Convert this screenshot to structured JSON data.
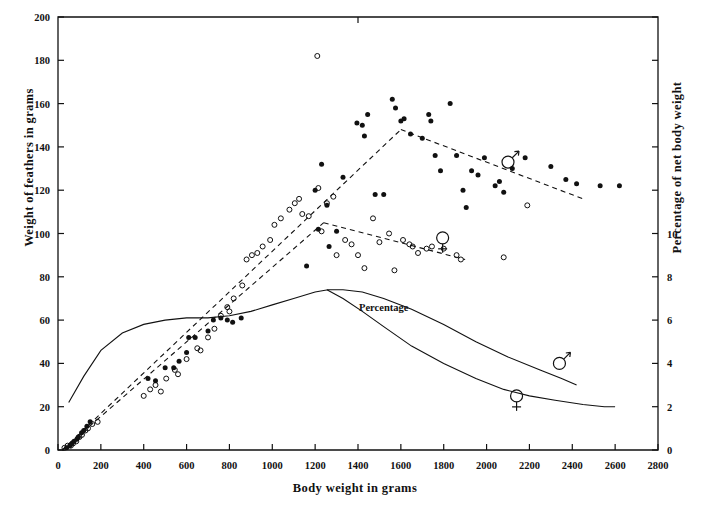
{
  "chart_data": {
    "type": "scatter",
    "title": "",
    "xlabel": "Body weight in grams",
    "ylabel": "Weight of feathers in grams",
    "ylabel_right": "Percentage of net body weight",
    "xlim": [
      0,
      2800
    ],
    "ylim": [
      0,
      200
    ],
    "ylim_right": [
      0,
      20
    ],
    "grid": false,
    "legend_position": "inline-annotations",
    "xticks": [
      0,
      200,
      400,
      600,
      800,
      1000,
      1200,
      1400,
      1600,
      1800,
      2000,
      2200,
      2400,
      2600,
      2800
    ],
    "xtick_labels": [
      "0",
      "200",
      "400",
      "600",
      "800",
      "1000",
      "1200",
      "1400",
      "1600",
      "1800",
      "2000",
      "2200",
      "2400",
      "2600",
      "2800"
    ],
    "yticks": [
      0,
      20,
      40,
      60,
      80,
      100,
      120,
      140,
      160,
      180,
      200
    ],
    "ytick_labels": [
      "0",
      "20",
      "40",
      "60",
      "80",
      "100",
      "120",
      "140",
      "160",
      "180",
      "200"
    ],
    "yticks_right": [
      0,
      2,
      4,
      6,
      8,
      10,
      12,
      14,
      16,
      18,
      20
    ],
    "ytick_labels_right": [
      "0",
      "2",
      "4",
      "6",
      "8",
      "10",
      "",
      "",
      "",
      "",
      ""
    ],
    "annotations": [
      {
        "text": "Percentage",
        "x": 1520,
        "y": 64,
        "kind": "curve-label"
      },
      {
        "text": "male-symbol",
        "x": 2340,
        "y": 40,
        "kind": "sex-symbol-on-percentage-curve"
      },
      {
        "text": "female-symbol",
        "x": 2140,
        "y": 25,
        "kind": "sex-symbol-on-percentage-curve"
      },
      {
        "text": "male-symbol",
        "x": 2100,
        "y": 133,
        "kind": "sex-symbol-on-regression-line"
      },
      {
        "text": "female-symbol",
        "x": 1795,
        "y": 98,
        "kind": "sex-symbol-on-regression-line"
      }
    ],
    "series": [
      {
        "name": "Males (filled circles)",
        "marker": "filled-circle",
        "color": "#111111",
        "points": [
          [
            40,
            1
          ],
          [
            55,
            2
          ],
          [
            65,
            3
          ],
          [
            75,
            4
          ],
          [
            88,
            5
          ],
          [
            95,
            6
          ],
          [
            110,
            8
          ],
          [
            120,
            9
          ],
          [
            135,
            11
          ],
          [
            150,
            13
          ],
          [
            420,
            33
          ],
          [
            455,
            32
          ],
          [
            500,
            38
          ],
          [
            540,
            38
          ],
          [
            565,
            41
          ],
          [
            600,
            45
          ],
          [
            610,
            52
          ],
          [
            640,
            52
          ],
          [
            700,
            55
          ],
          [
            725,
            60
          ],
          [
            760,
            61
          ],
          [
            790,
            60
          ],
          [
            815,
            59
          ],
          [
            855,
            61
          ],
          [
            1160,
            85
          ],
          [
            1200,
            120
          ],
          [
            1215,
            102
          ],
          [
            1230,
            132
          ],
          [
            1255,
            113
          ],
          [
            1265,
            94
          ],
          [
            1300,
            101
          ],
          [
            1330,
            126
          ],
          [
            1395,
            151
          ],
          [
            1420,
            150
          ],
          [
            1430,
            145
          ],
          [
            1445,
            155
          ],
          [
            1480,
            118
          ],
          [
            1520,
            118
          ],
          [
            1560,
            162
          ],
          [
            1575,
            158
          ],
          [
            1600,
            152
          ],
          [
            1615,
            153
          ],
          [
            1645,
            146
          ],
          [
            1700,
            144
          ],
          [
            1730,
            155
          ],
          [
            1740,
            152
          ],
          [
            1760,
            136
          ],
          [
            1785,
            129
          ],
          [
            1830,
            160
          ],
          [
            1860,
            136
          ],
          [
            1890,
            120
          ],
          [
            1905,
            112
          ],
          [
            1930,
            129
          ],
          [
            1960,
            127
          ],
          [
            1990,
            135
          ],
          [
            2040,
            122
          ],
          [
            2060,
            124
          ],
          [
            2080,
            119
          ],
          [
            2120,
            130
          ],
          [
            2180,
            135
          ],
          [
            2300,
            131
          ],
          [
            2370,
            125
          ],
          [
            2420,
            123
          ],
          [
            2530,
            122
          ],
          [
            2620,
            122
          ]
        ]
      },
      {
        "name": "Females (open circles)",
        "marker": "open-circle",
        "color": "#111111",
        "points": [
          [
            30,
            1
          ],
          [
            45,
            2
          ],
          [
            60,
            2
          ],
          [
            70,
            3
          ],
          [
            85,
            4
          ],
          [
            100,
            6
          ],
          [
            112,
            7
          ],
          [
            128,
            9
          ],
          [
            140,
            10
          ],
          [
            160,
            12
          ],
          [
            185,
            13
          ],
          [
            400,
            25
          ],
          [
            430,
            28
          ],
          [
            455,
            30
          ],
          [
            480,
            27
          ],
          [
            505,
            33
          ],
          [
            545,
            37
          ],
          [
            560,
            35
          ],
          [
            600,
            42
          ],
          [
            650,
            47
          ],
          [
            665,
            46
          ],
          [
            700,
            52
          ],
          [
            730,
            56
          ],
          [
            760,
            62
          ],
          [
            790,
            66
          ],
          [
            800,
            64
          ],
          [
            820,
            70
          ],
          [
            860,
            76
          ],
          [
            880,
            88
          ],
          [
            905,
            90
          ],
          [
            930,
            91
          ],
          [
            955,
            94
          ],
          [
            990,
            97
          ],
          [
            1010,
            104
          ],
          [
            1040,
            107
          ],
          [
            1080,
            111
          ],
          [
            1105,
            114
          ],
          [
            1125,
            116
          ],
          [
            1140,
            109
          ],
          [
            1170,
            108
          ],
          [
            1210,
            182
          ],
          [
            1215,
            121
          ],
          [
            1230,
            101
          ],
          [
            1255,
            114
          ],
          [
            1285,
            117
          ],
          [
            1300,
            90
          ],
          [
            1340,
            97
          ],
          [
            1370,
            95
          ],
          [
            1400,
            90
          ],
          [
            1430,
            84
          ],
          [
            1470,
            107
          ],
          [
            1500,
            96
          ],
          [
            1545,
            100
          ],
          [
            1570,
            83
          ],
          [
            1610,
            97
          ],
          [
            1640,
            95
          ],
          [
            1655,
            94
          ],
          [
            1680,
            91
          ],
          [
            1720,
            93
          ],
          [
            1745,
            94
          ],
          [
            1800,
            93
          ],
          [
            1860,
            90
          ],
          [
            1880,
            88
          ],
          [
            2080,
            89
          ],
          [
            2190,
            113
          ]
        ]
      }
    ],
    "regression_lines": [
      {
        "name": "males-regression",
        "style": "dashed",
        "segments": [
          [
            [
              20,
              0
            ],
            [
              1600,
              148
            ]
          ],
          [
            [
              1600,
              148
            ],
            [
              2450,
              116
            ]
          ]
        ]
      },
      {
        "name": "females-regression",
        "style": "dashed",
        "segments": [
          [
            [
              20,
              0
            ],
            [
              1240,
              105
            ]
          ],
          [
            [
              1240,
              105
            ],
            [
              1900,
              88
            ]
          ]
        ]
      }
    ],
    "percentage_curves": [
      {
        "name": "males-percentage-curve",
        "style": "solid",
        "points": [
          [
            50,
            22
          ],
          [
            120,
            34
          ],
          [
            200,
            46
          ],
          [
            300,
            54
          ],
          [
            400,
            58
          ],
          [
            500,
            60
          ],
          [
            600,
            61
          ],
          [
            700,
            61
          ],
          [
            800,
            62
          ],
          [
            900,
            64
          ],
          [
            1000,
            67
          ],
          [
            1100,
            70
          ],
          [
            1200,
            73
          ],
          [
            1260,
            74
          ],
          [
            1330,
            74
          ],
          [
            1420,
            73
          ],
          [
            1520,
            70
          ],
          [
            1650,
            65
          ],
          [
            1800,
            58
          ],
          [
            1950,
            50
          ],
          [
            2100,
            43
          ],
          [
            2250,
            37
          ],
          [
            2350,
            33
          ],
          [
            2420,
            30
          ]
        ]
      },
      {
        "name": "females-percentage-curve",
        "style": "solid",
        "points": [
          [
            1255,
            74
          ],
          [
            1330,
            70
          ],
          [
            1420,
            64
          ],
          [
            1520,
            57
          ],
          [
            1650,
            48
          ],
          [
            1800,
            40
          ],
          [
            1950,
            33
          ],
          [
            2080,
            28
          ],
          [
            2200,
            25
          ],
          [
            2320,
            23
          ],
          [
            2450,
            21
          ],
          [
            2550,
            20
          ],
          [
            2600,
            20
          ]
        ]
      }
    ]
  },
  "axis_titles": {
    "left": "Weight of feathers in grams",
    "right": "Percentage of net body weight",
    "bottom": "Body weight in grams"
  },
  "colors": {
    "axis": "#111111",
    "marker_fill": "#111111",
    "curve": "#111111",
    "background": "#ffffff"
  }
}
